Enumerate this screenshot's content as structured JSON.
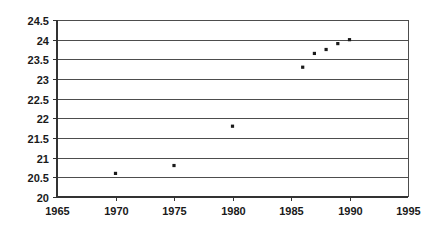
{
  "chart_data": {
    "type": "scatter",
    "title": "",
    "xlabel": "",
    "ylabel": "",
    "xlim": [
      1965,
      1995
    ],
    "ylim": [
      20,
      24.5
    ],
    "grid": true,
    "legend": false,
    "x_ticks": [
      1965,
      1970,
      1975,
      1980,
      1985,
      1990,
      1995
    ],
    "y_ticks": [
      20,
      20.5,
      21,
      21.5,
      22,
      22.5,
      23,
      23.5,
      24,
      24.5
    ],
    "x_tick_labels": [
      "1965",
      "1970",
      "1975",
      "1980",
      "1985",
      "1990",
      "1995"
    ],
    "y_tick_labels": [
      "20",
      "20.5",
      "21",
      "21.5",
      "22",
      "22.5",
      "23",
      "23.5",
      "24",
      "24.5"
    ],
    "series": [
      {
        "name": "series-1",
        "marker": "square",
        "color": "#1a1a1a",
        "x": [
          1970,
          1975,
          1980,
          1986,
          1987,
          1988,
          1989,
          1990
        ],
        "y": [
          20.6,
          20.8,
          21.8,
          23.3,
          23.65,
          23.75,
          23.9,
          24.0
        ]
      }
    ]
  },
  "axes": {
    "marker_size": 3.2,
    "grid_color": "#4d4d4d",
    "axis_color": "#333333",
    "background": "#ffffff"
  }
}
